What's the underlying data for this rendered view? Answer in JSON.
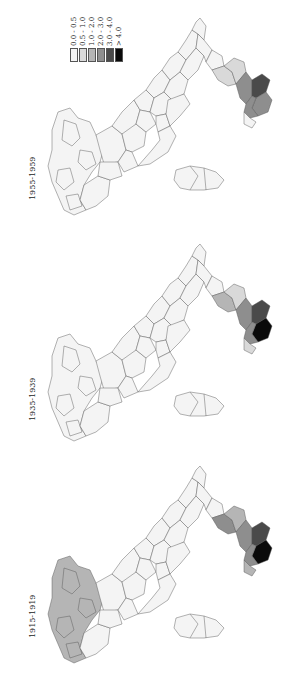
{
  "legend": {
    "items": [
      {
        "label": "0.0 - 0.5",
        "color": "#f4f4f4"
      },
      {
        "label": "0.5 - 1.0",
        "color": "#d9d9d9"
      },
      {
        "label": "1.0 - 2.0",
        "color": "#b5b5b5"
      },
      {
        "label": "2.0 - 3.0",
        "color": "#8e8e8e"
      },
      {
        "label": "3.0 - 4.0",
        "color": "#4a4a4a"
      },
      {
        "label": "> 4.0",
        "color": "#0a0a0a"
      }
    ]
  },
  "panels": [
    {
      "period": "1955-1959",
      "top": 0,
      "colors": {
        "south_tip": "#8e8e8e",
        "calabria_core": "#4a4a4a",
        "calabria_edge": "#8e8e8e",
        "basilicata": "#d9d9d9",
        "puglia_toe": "#d9d9d9",
        "north_west": "#f4f4f4",
        "north_east": "#f4f4f4",
        "central": "#f4f4f4",
        "sardinia": "#f4f4f4",
        "sicily_tip": "#f4f4f4"
      }
    },
    {
      "period": "1935-1939",
      "top": 226,
      "colors": {
        "south_tip": "#0a0a0a",
        "calabria_core": "#4a4a4a",
        "calabria_edge": "#8e8e8e",
        "basilicata": "#b5b5b5",
        "puglia_toe": "#d9d9d9",
        "north_west": "#f4f4f4",
        "north_east": "#f4f4f4",
        "central": "#f4f4f4",
        "sardinia": "#f4f4f4",
        "sicily_tip": "#d9d9d9"
      }
    },
    {
      "period": "1915-1919",
      "top": 448,
      "colors": {
        "south_tip": "#0a0a0a",
        "calabria_core": "#4a4a4a",
        "calabria_edge": "#8e8e8e",
        "basilicata": "#8e8e8e",
        "puglia_toe": "#b5b5b5",
        "north_west": "#b5b5b5",
        "north_east": "#f4f4f4",
        "central": "#f4f4f4",
        "sardinia": "#f4f4f4",
        "sicily_tip": "#b5b5b5"
      }
    }
  ]
}
